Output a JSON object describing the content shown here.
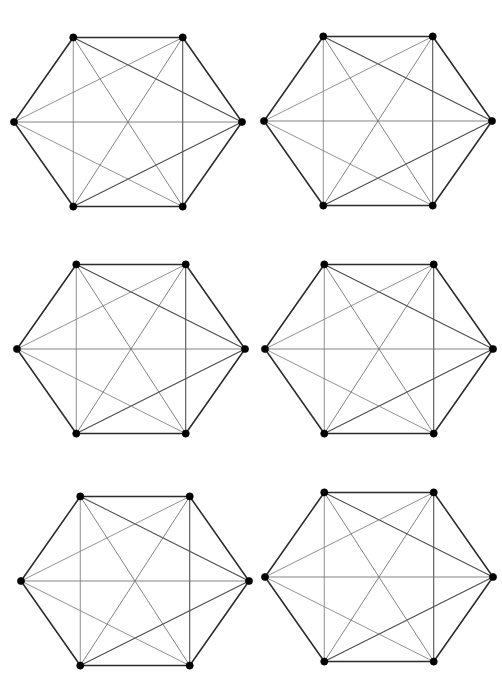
{
  "figure": {
    "canvas_width": 502,
    "canvas_height": 695,
    "background_color": "#ffffff",
    "panel_count": 6,
    "grid_rows": 3,
    "grid_columns": 2
  },
  "style": {
    "perimeter_color": "#2b2b2b",
    "long_diagonal_color": "#6e6e6e",
    "short_diagonal_color": "#7d7d7d",
    "short_diagonal_dark_color": "#4a4a4a",
    "vertex_color": "#000000",
    "perimeter_width": 1.55,
    "diagonal_width": 0.85,
    "vertex_radius": 3.6
  },
  "graph": {
    "name": "K6",
    "vertex_count": 6,
    "edge_count": 15,
    "vertex_labels": [
      "top-left",
      "top-right",
      "right",
      "bottom-right",
      "bottom-left",
      "left"
    ],
    "vertices_normalized": [
      {
        "id": 0,
        "name": "top-left",
        "x": 0.26,
        "y": 0.055
      },
      {
        "id": 1,
        "name": "top-right",
        "x": 0.74,
        "y": 0.055
      },
      {
        "id": 2,
        "name": "right",
        "x": 1.0,
        "y": 0.5
      },
      {
        "id": 3,
        "name": "bottom-right",
        "x": 0.74,
        "y": 0.945
      },
      {
        "id": 4,
        "name": "bottom-left",
        "x": 0.26,
        "y": 0.945
      },
      {
        "id": 5,
        "name": "left",
        "x": 0.0,
        "y": 0.5
      }
    ],
    "perimeter_edges": [
      [
        0,
        1
      ],
      [
        1,
        2
      ],
      [
        2,
        3
      ],
      [
        3,
        4
      ],
      [
        4,
        5
      ],
      [
        5,
        0
      ]
    ],
    "long_diagonal_edges": [
      [
        0,
        3
      ],
      [
        1,
        4
      ],
      [
        2,
        5
      ]
    ],
    "short_diagonal_edges": [
      [
        0,
        2
      ],
      [
        1,
        3
      ],
      [
        2,
        4
      ],
      [
        3,
        5
      ],
      [
        4,
        0
      ],
      [
        5,
        1
      ]
    ]
  },
  "panels": [
    {
      "id": "panel-1",
      "row": 1,
      "column": 1,
      "left": 14,
      "top": 27,
      "width": 228,
      "height": 190
    },
    {
      "id": "panel-2",
      "row": 1,
      "column": 2,
      "left": 264,
      "top": 26,
      "width": 228,
      "height": 190
    },
    {
      "id": "panel-3",
      "row": 2,
      "column": 1,
      "left": 17,
      "top": 254,
      "width": 228,
      "height": 190
    },
    {
      "id": "panel-4",
      "row": 2,
      "column": 2,
      "left": 265,
      "top": 254,
      "width": 228,
      "height": 190
    },
    {
      "id": "panel-5",
      "row": 3,
      "column": 1,
      "left": 21,
      "top": 486,
      "width": 228,
      "height": 190
    },
    {
      "id": "panel-6",
      "row": 3,
      "column": 2,
      "left": 265,
      "top": 482,
      "width": 228,
      "height": 190
    }
  ]
}
